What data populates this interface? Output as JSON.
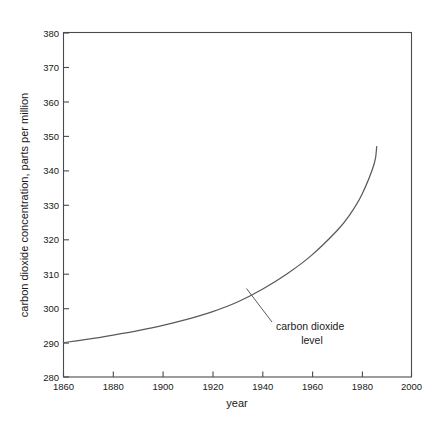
{
  "chart_data": {
    "type": "line",
    "title": "",
    "subtitle": "",
    "xlabel": "year",
    "ylabel": "carbon dioxide concentration, parts per million",
    "xlim": [
      1860,
      2000
    ],
    "ylim": [
      280,
      380
    ],
    "xticks": [
      1860,
      1880,
      1900,
      1920,
      1940,
      1960,
      1980,
      2000
    ],
    "yticks": [
      280,
      290,
      300,
      310,
      320,
      330,
      340,
      350,
      360,
      370,
      380
    ],
    "xtick_labels": [
      "1860",
      "1880",
      "1900",
      "1920",
      "1940",
      "1960",
      "1980",
      "2000"
    ],
    "ytick_labels": [
      "280",
      "290",
      "300",
      "310",
      "320",
      "330",
      "340",
      "350",
      "360",
      "370",
      "380"
    ],
    "grid": false,
    "legend": false,
    "legend_position": "none",
    "series": [
      {
        "name": "carbon dioxide level",
        "color": "#5a5a5a",
        "x": [
          1860,
          1870,
          1880,
          1890,
          1900,
          1910,
          1920,
          1930,
          1940,
          1950,
          1960,
          1970,
          1975,
          1980,
          1985,
          1986
        ],
        "values": [
          290.0,
          291.0,
          292.2,
          293.5,
          295.0,
          296.8,
          299.0,
          301.8,
          305.5,
          310.0,
          315.5,
          322.5,
          327.0,
          333.0,
          342.0,
          347.0
        ]
      }
    ],
    "annotations": [
      {
        "name": "carbon-dioxide-level",
        "lines": [
          "carbon dioxide",
          "level"
        ],
        "points_to_x": 1937,
        "points_to_y": 306
      }
    ]
  },
  "axis": {
    "x_title": "year",
    "y_title": "carbon dioxide concentration, parts per million"
  },
  "annotation": {
    "line1": "carbon dioxide",
    "line2": "level"
  },
  "colors": {
    "background": "#ffffff",
    "axis": "#4a4a4a",
    "curve": "#5a5a5a",
    "text": "#1a1a1a"
  }
}
